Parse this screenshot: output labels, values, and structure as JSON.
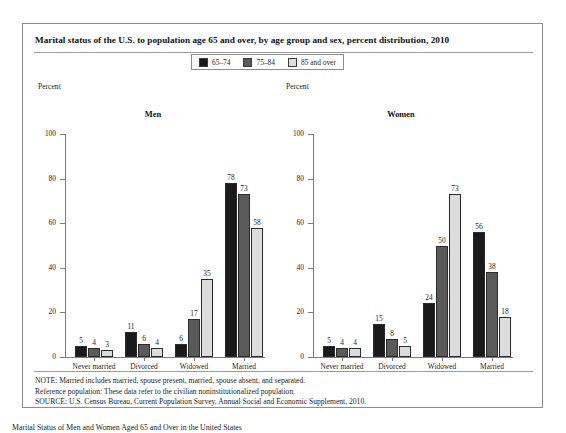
{
  "figure": {
    "title": "Marital status of the U.S. to population age 65 and over, by age group and sex, percent distribution, 2010",
    "axis_title": "Percent",
    "panels": [
      "Men",
      "Women"
    ],
    "footnotes": [
      "NOTE: Married includes married, spouse present, married, spouse absent, and separated.",
      "Reference population: These data refer to the civilian noninstitutionalized population.",
      "SOURCE: U.S. Census Bureau, Current Population Survey, Annual Social and Economic Supplement, 2010."
    ],
    "caption": "Marital Status of Men and Women Aged 65 and Over in the United States"
  },
  "legend": {
    "entries": [
      {
        "label": "65–74",
        "color": "#1a1a1a"
      },
      {
        "label": "75–84",
        "color": "#5a5a5a"
      },
      {
        "label": "85 and over",
        "color": "#dcdcdc"
      }
    ]
  },
  "chart_data": {
    "type": "bar",
    "title": "Marital status of the U.S. to population age 65 and over, by age group and sex, percent distribution, 2010",
    "xlabel": "",
    "ylabel": "Percent",
    "ylim": [
      0,
      100
    ],
    "yticks": [
      0,
      20,
      40,
      60,
      80,
      100
    ],
    "grid": false,
    "legend_position": "top-center",
    "categories": [
      "Never married",
      "Divorced",
      "Widowed",
      "Married"
    ],
    "panels": [
      {
        "name": "Men",
        "series": [
          {
            "name": "65–74",
            "color": "#1a1a1a",
            "values": [
              5,
              11,
              6,
              78
            ]
          },
          {
            "name": "75–84",
            "color": "#5a5a5a",
            "values": [
              4,
              6,
              17,
              73
            ]
          },
          {
            "name": "85 and over",
            "color": "#dcdcdc",
            "values": [
              3,
              4,
              35,
              58
            ]
          }
        ]
      },
      {
        "name": "Women",
        "series": [
          {
            "name": "65–74",
            "color": "#1a1a1a",
            "values": [
              5,
              15,
              24,
              56
            ]
          },
          {
            "name": "75–84",
            "color": "#5a5a5a",
            "values": [
              4,
              8,
              50,
              38
            ]
          },
          {
            "name": "85 and over",
            "color": "#dcdcdc",
            "values": [
              4,
              5,
              73,
              18
            ]
          }
        ]
      }
    ]
  }
}
